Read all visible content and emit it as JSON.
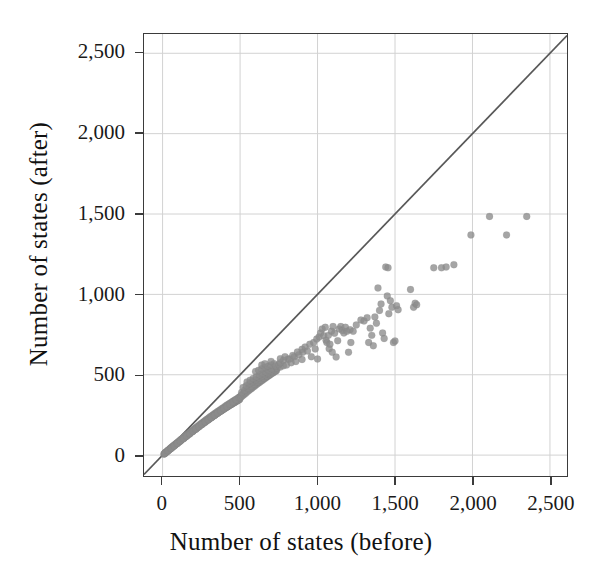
{
  "chart_data": {
    "type": "scatter",
    "title": "",
    "xlabel": "Number of states (before)",
    "ylabel": "Number of states (after)",
    "xlim": [
      -120,
      2610
    ],
    "ylim": [
      -130,
      2620
    ],
    "xticks": [
      0,
      500,
      1000,
      1500,
      2000,
      2500
    ],
    "yticks": [
      0,
      500,
      1000,
      1500,
      2000,
      2500
    ],
    "xticklabels": [
      "0",
      "500",
      "1,000",
      "1,500",
      "2,000",
      "2,500"
    ],
    "yticklabels": [
      "0",
      "500",
      "1,000",
      "1,500",
      "2,000",
      "2,500"
    ],
    "grid": true,
    "legend": "none",
    "marker": {
      "shape": "circle",
      "color": "#8c8c8c",
      "opacity": 0.78,
      "size_px": 7
    },
    "reference_line": {
      "label": "y = x identity line",
      "color": "#585858",
      "from": [
        -120,
        -120
      ],
      "to": [
        2610,
        2610
      ]
    },
    "points": [
      [
        8,
        6
      ],
      [
        14,
        11
      ],
      [
        18,
        14
      ],
      [
        22,
        18
      ],
      [
        26,
        20
      ],
      [
        30,
        24
      ],
      [
        34,
        27
      ],
      [
        38,
        30
      ],
      [
        42,
        33
      ],
      [
        46,
        36
      ],
      [
        50,
        40
      ],
      [
        54,
        42
      ],
      [
        58,
        46
      ],
      [
        62,
        48
      ],
      [
        66,
        52
      ],
      [
        70,
        55
      ],
      [
        74,
        58
      ],
      [
        78,
        61
      ],
      [
        82,
        64
      ],
      [
        86,
        67
      ],
      [
        90,
        70
      ],
      [
        94,
        73
      ],
      [
        98,
        76
      ],
      [
        102,
        80
      ],
      [
        106,
        82
      ],
      [
        110,
        86
      ],
      [
        114,
        88
      ],
      [
        118,
        92
      ],
      [
        122,
        95
      ],
      [
        126,
        98
      ],
      [
        130,
        101
      ],
      [
        134,
        104
      ],
      [
        138,
        107
      ],
      [
        142,
        110
      ],
      [
        146,
        113
      ],
      [
        150,
        116
      ],
      [
        154,
        119
      ],
      [
        158,
        122
      ],
      [
        162,
        125
      ],
      [
        166,
        128
      ],
      [
        170,
        131
      ],
      [
        174,
        134
      ],
      [
        178,
        137
      ],
      [
        182,
        140
      ],
      [
        186,
        143
      ],
      [
        190,
        146
      ],
      [
        194,
        149
      ],
      [
        198,
        152
      ],
      [
        202,
        155
      ],
      [
        206,
        158
      ],
      [
        210,
        161
      ],
      [
        214,
        163
      ],
      [
        218,
        166
      ],
      [
        222,
        169
      ],
      [
        226,
        172
      ],
      [
        230,
        175
      ],
      [
        234,
        178
      ],
      [
        238,
        181
      ],
      [
        242,
        184
      ],
      [
        246,
        187
      ],
      [
        250,
        190
      ],
      [
        254,
        192
      ],
      [
        258,
        195
      ],
      [
        262,
        198
      ],
      [
        266,
        201
      ],
      [
        270,
        204
      ],
      [
        274,
        206
      ],
      [
        278,
        209
      ],
      [
        282,
        212
      ],
      [
        286,
        215
      ],
      [
        290,
        218
      ],
      [
        294,
        220
      ],
      [
        298,
        223
      ],
      [
        302,
        226
      ],
      [
        306,
        229
      ],
      [
        310,
        231
      ],
      [
        314,
        234
      ],
      [
        318,
        237
      ],
      [
        322,
        239
      ],
      [
        326,
        242
      ],
      [
        330,
        245
      ],
      [
        334,
        247
      ],
      [
        338,
        250
      ],
      [
        342,
        253
      ],
      [
        346,
        255
      ],
      [
        350,
        258
      ],
      [
        354,
        261
      ],
      [
        358,
        263
      ],
      [
        362,
        266
      ],
      [
        366,
        268
      ],
      [
        370,
        271
      ],
      [
        374,
        273
      ],
      [
        378,
        276
      ],
      [
        382,
        278
      ],
      [
        386,
        281
      ],
      [
        390,
        283
      ],
      [
        394,
        286
      ],
      [
        398,
        288
      ],
      [
        402,
        291
      ],
      [
        406,
        293
      ],
      [
        410,
        296
      ],
      [
        414,
        298
      ],
      [
        418,
        301
      ],
      [
        422,
        303
      ],
      [
        426,
        305
      ],
      [
        430,
        308
      ],
      [
        434,
        310
      ],
      [
        438,
        313
      ],
      [
        442,
        315
      ],
      [
        446,
        317
      ],
      [
        450,
        320
      ],
      [
        454,
        322
      ],
      [
        458,
        324
      ],
      [
        462,
        327
      ],
      [
        466,
        329
      ],
      [
        470,
        331
      ],
      [
        474,
        334
      ],
      [
        478,
        336
      ],
      [
        482,
        338
      ],
      [
        486,
        341
      ],
      [
        490,
        343
      ],
      [
        494,
        345
      ],
      [
        498,
        347
      ],
      [
        12,
        9
      ],
      [
        20,
        17
      ],
      [
        28,
        22
      ],
      [
        36,
        31
      ],
      [
        44,
        35
      ],
      [
        52,
        44
      ],
      [
        60,
        50
      ],
      [
        68,
        56
      ],
      [
        76,
        63
      ],
      [
        84,
        69
      ],
      [
        92,
        75
      ],
      [
        100,
        82
      ],
      [
        108,
        88
      ],
      [
        116,
        95
      ],
      [
        124,
        100
      ],
      [
        132,
        107
      ],
      [
        140,
        113
      ],
      [
        148,
        120
      ],
      [
        156,
        125
      ],
      [
        164,
        132
      ],
      [
        172,
        138
      ],
      [
        180,
        144
      ],
      [
        188,
        150
      ],
      [
        196,
        156
      ],
      [
        204,
        162
      ],
      [
        212,
        168
      ],
      [
        220,
        174
      ],
      [
        228,
        180
      ],
      [
        236,
        186
      ],
      [
        244,
        192
      ],
      [
        252,
        198
      ],
      [
        260,
        203
      ],
      [
        268,
        209
      ],
      [
        276,
        215
      ],
      [
        284,
        221
      ],
      [
        292,
        226
      ],
      [
        300,
        232
      ],
      [
        308,
        238
      ],
      [
        316,
        243
      ],
      [
        324,
        249
      ],
      [
        332,
        254
      ],
      [
        340,
        260
      ],
      [
        348,
        265
      ],
      [
        356,
        271
      ],
      [
        364,
        276
      ],
      [
        372,
        281
      ],
      [
        380,
        287
      ],
      [
        388,
        292
      ],
      [
        396,
        297
      ],
      [
        404,
        303
      ],
      [
        412,
        308
      ],
      [
        420,
        313
      ],
      [
        428,
        318
      ],
      [
        436,
        323
      ],
      [
        444,
        328
      ],
      [
        452,
        333
      ],
      [
        460,
        338
      ],
      [
        468,
        343
      ],
      [
        476,
        348
      ],
      [
        484,
        353
      ],
      [
        492,
        358
      ],
      [
        500,
        363
      ],
      [
        15,
        10
      ],
      [
        35,
        26
      ],
      [
        55,
        41
      ],
      [
        75,
        57
      ],
      [
        95,
        72
      ],
      [
        115,
        87
      ],
      [
        135,
        102
      ],
      [
        155,
        117
      ],
      [
        175,
        132
      ],
      [
        195,
        147
      ],
      [
        215,
        161
      ],
      [
        235,
        176
      ],
      [
        255,
        190
      ],
      [
        275,
        205
      ],
      [
        295,
        219
      ],
      [
        315,
        233
      ],
      [
        335,
        247
      ],
      [
        355,
        261
      ],
      [
        375,
        275
      ],
      [
        395,
        289
      ],
      [
        415,
        302
      ],
      [
        435,
        316
      ],
      [
        455,
        329
      ],
      [
        475,
        343
      ],
      [
        495,
        356
      ],
      [
        505,
        368
      ],
      [
        512,
        375
      ],
      [
        520,
        381
      ],
      [
        528,
        388
      ],
      [
        536,
        394
      ],
      [
        544,
        400
      ],
      [
        552,
        406
      ],
      [
        560,
        412
      ],
      [
        568,
        418
      ],
      [
        576,
        424
      ],
      [
        584,
        430
      ],
      [
        592,
        436
      ],
      [
        600,
        442
      ],
      [
        608,
        447
      ],
      [
        616,
        453
      ],
      [
        624,
        458
      ],
      [
        632,
        464
      ],
      [
        640,
        469
      ],
      [
        648,
        474
      ],
      [
        656,
        480
      ],
      [
        664,
        485
      ],
      [
        672,
        490
      ],
      [
        680,
        495
      ],
      [
        688,
        500
      ],
      [
        505,
        360
      ],
      [
        515,
        368
      ],
      [
        525,
        376
      ],
      [
        535,
        384
      ],
      [
        545,
        392
      ],
      [
        555,
        400
      ],
      [
        565,
        408
      ],
      [
        575,
        415
      ],
      [
        585,
        423
      ],
      [
        595,
        430
      ],
      [
        605,
        438
      ],
      [
        615,
        445
      ],
      [
        625,
        452
      ],
      [
        635,
        459
      ],
      [
        645,
        466
      ],
      [
        655,
        473
      ],
      [
        665,
        480
      ],
      [
        675,
        487
      ],
      [
        685,
        493
      ],
      [
        695,
        500
      ],
      [
        705,
        507
      ],
      [
        715,
        513
      ],
      [
        725,
        520
      ],
      [
        735,
        526
      ],
      [
        510,
        390
      ],
      [
        530,
        403
      ],
      [
        550,
        416
      ],
      [
        570,
        429
      ],
      [
        590,
        441
      ],
      [
        610,
        454
      ],
      [
        630,
        466
      ],
      [
        650,
        478
      ],
      [
        670,
        490
      ],
      [
        690,
        501
      ],
      [
        710,
        513
      ],
      [
        730,
        524
      ],
      [
        520,
        420
      ],
      [
        540,
        432
      ],
      [
        560,
        444
      ],
      [
        580,
        456
      ],
      [
        600,
        468
      ],
      [
        620,
        479
      ],
      [
        640,
        490
      ],
      [
        660,
        501
      ],
      [
        680,
        512
      ],
      [
        700,
        523
      ],
      [
        720,
        533
      ],
      [
        545,
        455
      ],
      [
        565,
        466
      ],
      [
        585,
        477
      ],
      [
        605,
        487
      ],
      [
        625,
        498
      ],
      [
        645,
        508
      ],
      [
        665,
        518
      ],
      [
        685,
        528
      ],
      [
        705,
        538
      ],
      [
        600,
        520
      ],
      [
        620,
        528
      ],
      [
        640,
        537
      ],
      [
        660,
        545
      ],
      [
        680,
        553
      ],
      [
        700,
        561
      ],
      [
        720,
        569
      ],
      [
        740,
        540
      ],
      [
        760,
        548
      ],
      [
        780,
        556
      ],
      [
        640,
        560
      ],
      [
        660,
        568
      ],
      [
        700,
        583
      ],
      [
        730,
        555
      ],
      [
        750,
        563
      ],
      [
        760,
        575
      ],
      [
        780,
        590
      ],
      [
        800,
        560
      ],
      [
        810,
        598
      ],
      [
        830,
        575
      ],
      [
        850,
        612
      ],
      [
        860,
        582
      ],
      [
        880,
        625
      ],
      [
        900,
        595
      ],
      [
        905,
        640
      ],
      [
        760,
        600
      ],
      [
        790,
        612
      ],
      [
        820,
        598
      ],
      [
        840,
        620
      ],
      [
        870,
        642
      ],
      [
        900,
        658
      ],
      [
        920,
        672
      ],
      [
        935,
        648
      ],
      [
        950,
        690
      ],
      [
        960,
        612
      ],
      [
        975,
        700
      ],
      [
        985,
        660
      ],
      [
        995,
        722
      ],
      [
        1000,
        598
      ],
      [
        1010,
        735
      ],
      [
        1020,
        760
      ],
      [
        1030,
        785
      ],
      [
        1040,
        742
      ],
      [
        1050,
        795
      ],
      [
        1055,
        715
      ],
      [
        1060,
        700
      ],
      [
        1070,
        745
      ],
      [
        1075,
        662
      ],
      [
        1080,
        690
      ],
      [
        1090,
        770
      ],
      [
        1095,
        640
      ],
      [
        1100,
        800
      ],
      [
        1110,
        758
      ],
      [
        1120,
        610
      ],
      [
        1130,
        712
      ],
      [
        1140,
        785
      ],
      [
        1150,
        800
      ],
      [
        1160,
        775
      ],
      [
        1170,
        760
      ],
      [
        1180,
        795
      ],
      [
        1190,
        770
      ],
      [
        1200,
        640
      ],
      [
        1210,
        780
      ],
      [
        1215,
        700
      ],
      [
        1230,
        770
      ],
      [
        1250,
        810
      ],
      [
        1280,
        840
      ],
      [
        1300,
        835
      ],
      [
        1320,
        855
      ],
      [
        1330,
        700
      ],
      [
        1340,
        790
      ],
      [
        1350,
        745
      ],
      [
        1360,
        680
      ],
      [
        1370,
        860
      ],
      [
        1380,
        820
      ],
      [
        1390,
        1040
      ],
      [
        1400,
        900
      ],
      [
        1410,
        940
      ],
      [
        1420,
        760
      ],
      [
        1430,
        725
      ],
      [
        1440,
        1170
      ],
      [
        1450,
        990
      ],
      [
        1455,
        1165
      ],
      [
        1460,
        880
      ],
      [
        1470,
        960
      ],
      [
        1480,
        920
      ],
      [
        1490,
        700
      ],
      [
        1500,
        710
      ],
      [
        1510,
        930
      ],
      [
        1520,
        905
      ],
      [
        1600,
        1030
      ],
      [
        1620,
        920
      ],
      [
        1630,
        945
      ],
      [
        1640,
        935
      ],
      [
        1750,
        1165
      ],
      [
        1800,
        1165
      ],
      [
        1830,
        1170
      ],
      [
        1880,
        1185
      ],
      [
        1990,
        1370
      ],
      [
        2110,
        1485
      ],
      [
        2220,
        1370
      ],
      [
        2350,
        1485
      ]
    ]
  },
  "axes": {
    "x_label": "Number of states (before)",
    "y_label": "Number of states (after)",
    "x_tick_labels": [
      "0",
      "500",
      "1,000",
      "1,500",
      "2,000",
      "2,500"
    ],
    "y_tick_labels": [
      "0",
      "500",
      "1,000",
      "1,500",
      "2,000",
      "2,500"
    ]
  },
  "colors": {
    "point": "#8c8c8c",
    "reference_line": "#585858",
    "grid": "#d2d2d2",
    "frame": "#3b3b3b",
    "text": "#1a1a1a",
    "background": "#ffffff"
  }
}
